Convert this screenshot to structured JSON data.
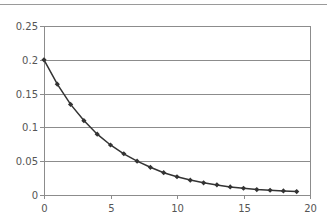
{
  "chart_data": {
    "type": "line",
    "title": "",
    "xlabel": "",
    "ylabel": "",
    "xlim": [
      0,
      20
    ],
    "ylim": [
      0,
      0.25
    ],
    "x_ticks": [
      0,
      5,
      10,
      15,
      20
    ],
    "x_tick_labels": [
      "0",
      "5",
      "10",
      "15",
      "20"
    ],
    "y_ticks": [
      0,
      0.05,
      0.1,
      0.15,
      0.2,
      0.25
    ],
    "y_tick_labels": [
      "0",
      "0.05",
      "0.1",
      "0.15",
      "0.2",
      "0.25"
    ],
    "grid": {
      "horizontal": true,
      "vertical": false
    },
    "legend": null,
    "series": [
      {
        "name": "series-1",
        "marker": "diamond",
        "color": "#333333",
        "x": [
          0,
          1,
          2,
          3,
          4,
          5,
          6,
          7,
          8,
          9,
          10,
          11,
          12,
          13,
          14,
          15,
          16,
          17,
          18,
          19
        ],
        "values": [
          0.2,
          0.164,
          0.134,
          0.11,
          0.09,
          0.074,
          0.061,
          0.05,
          0.041,
          0.033,
          0.027,
          0.022,
          0.018,
          0.015,
          0.012,
          0.01,
          0.008,
          0.007,
          0.006,
          0.005
        ]
      }
    ]
  },
  "colors": {
    "gridline": "#8c8c8c",
    "axis": "#8c8c8c",
    "top_rule": "#9a9a9a",
    "line": "#333333",
    "tick_label": "#555555"
  }
}
